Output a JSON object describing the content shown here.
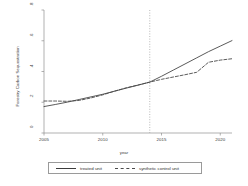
{
  "chart_data": {
    "type": "line",
    "title": "",
    "xlabel": "year",
    "ylabel": "Forestry Carbon Sequestration",
    "xlim": [
      2005,
      2021
    ],
    "ylim": [
      0,
      0.8
    ],
    "xticks": [
      2005,
      2010,
      2015,
      2020
    ],
    "xtick_labels": [
      "2005",
      "2010",
      "2015",
      "2020"
    ],
    "yticks": [
      0,
      0.2,
      0.4,
      0.6,
      0.8
    ],
    "ytick_labels": [
      "0",
      ".2",
      ".4",
      ".6",
      ".8"
    ],
    "grid": false,
    "legend_position": "below",
    "annotations": [
      {
        "type": "vline",
        "x": 2014,
        "style": "dotted",
        "label": ""
      }
    ],
    "series": [
      {
        "name": "treated unit",
        "style": "solid",
        "color": "#3c3c3c",
        "x": [
          2005,
          2006,
          2007,
          2008,
          2009,
          2010,
          2011,
          2012,
          2013,
          2014,
          2015,
          2016,
          2017,
          2018,
          2019,
          2020,
          2021
        ],
        "y": [
          0.172,
          0.186,
          0.201,
          0.218,
          0.235,
          0.252,
          0.272,
          0.292,
          0.311,
          0.331,
          0.369,
          0.409,
          0.449,
          0.489,
          0.529,
          0.565,
          0.601
        ]
      },
      {
        "name": "synthetic control unit",
        "style": "dashed",
        "color": "#4a4a4a",
        "x": [
          2005,
          2006,
          2007,
          2008,
          2009,
          2010,
          2011,
          2012,
          2013,
          2014,
          2015,
          2016,
          2017,
          2018,
          2019,
          2020,
          2021
        ],
        "y": [
          0.208,
          0.208,
          0.206,
          0.212,
          0.228,
          0.248,
          0.272,
          0.294,
          0.312,
          0.331,
          0.349,
          0.364,
          0.379,
          0.395,
          0.46,
          0.474,
          0.483
        ]
      }
    ]
  },
  "legend": {
    "items": [
      {
        "label": "treated unit",
        "style": "solid"
      },
      {
        "label": "synthetic control unit",
        "style": "dashed"
      }
    ]
  },
  "axes": {
    "x_title": "year",
    "y_title": "Forestry Carbon Sequestration"
  }
}
